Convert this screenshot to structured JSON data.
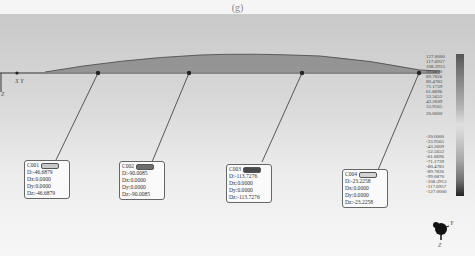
{
  "caption": "(g)",
  "view": {
    "global_axes": {
      "xy_label": "X Y",
      "z_label": "Z"
    },
    "triad": {
      "y_label": "Y",
      "x_label": "X",
      "z_label": "Z"
    }
  },
  "probes": [
    {
      "id": "C001",
      "swatch_color": "#c8c8c8",
      "D": "D:-46.6879",
      "Dx": "Dx:0.0000",
      "Dy": "Dy:0.0000",
      "Dz": "Dz:-46.6879"
    },
    {
      "id": "C002",
      "swatch_color": "#6e6e6e",
      "D": "D:-90.0085",
      "Dx": "Dx:0.0000",
      "Dy": "Dy:0.0000",
      "Dz": "Dz:-90.0085"
    },
    {
      "id": "C003",
      "swatch_color": "#4a4a4a",
      "D": "D:-113.7276",
      "Dx": "Dx:0.0000",
      "Dy": "Dy:0.0000",
      "Dz": "Dz:-113.7276"
    },
    {
      "id": "C004",
      "swatch_color": "#d4d4d4",
      "D": "D:-23.2258",
      "Dx": "Dx:0.0000",
      "Dy": "Dy:0.0000",
      "Dz": "Dz:-23.2258"
    }
  ],
  "legend": {
    "labels": [
      "127.0000",
      "117.6957",
      "108.3913",
      "99.0870",
      "89.7826",
      "80.4783",
      "71.1739",
      "61.8696",
      "52.5652",
      "43.2609",
      "33.9565",
      "20.0000",
      "-20.0000",
      "-33.9565",
      "-43.2609",
      "-52.5652",
      "-61.8696",
      "-71.1739",
      "-80.4783",
      "-89.7826",
      "-99.0870",
      "-108.3913",
      "-117.6957",
      "-127.0000"
    ]
  }
}
